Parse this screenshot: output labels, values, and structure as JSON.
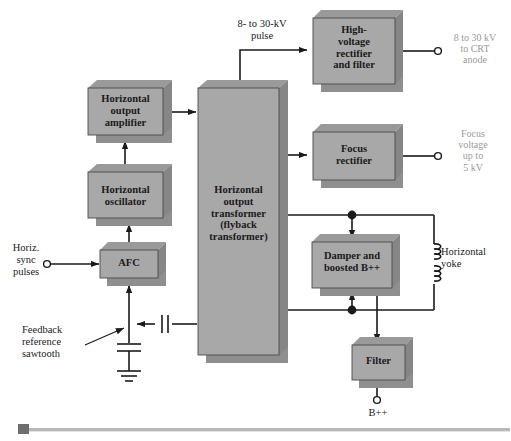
{
  "diagram": {
    "colors": {
      "block_face": "#a8a8a8",
      "block_side": "#8a8a8a",
      "block_shadow": "#8f8f8f",
      "line": "#1a1a1a",
      "gray_label": "#9a9a9a",
      "footer_rule": "#b9b9b9",
      "footer_square": "#6e6e6e"
    },
    "blocks": [
      {
        "id": "hout_amp",
        "label": "Horizontal\noutput\namplifier"
      },
      {
        "id": "hosc",
        "label": "Horizontal\noscillator"
      },
      {
        "id": "afc",
        "label": "AFC"
      },
      {
        "id": "transformer",
        "label": "Horizontal\noutput\ntransformer\n(flyback\ntransformer)"
      },
      {
        "id": "hv_rect",
        "label": "High-\nvoltage\nrectifier\nand filter"
      },
      {
        "id": "focus_rect",
        "label": "Focus\nrectifier"
      },
      {
        "id": "damper",
        "label": "Damper and\nboosted B++"
      },
      {
        "id": "filter",
        "label": "Filter"
      }
    ],
    "signal_labels": [
      {
        "id": "hv_pulse",
        "text": "8- to 30-kV\npulse"
      },
      {
        "id": "sync_in",
        "text": "Horiz.\nsync\npulses"
      },
      {
        "id": "feedback",
        "text": "Feedback\nreference\nsawtooth"
      },
      {
        "id": "yoke",
        "text": "Horizontal\nyoke"
      },
      {
        "id": "bpp_terminal",
        "text": "B++"
      }
    ],
    "output_labels": [
      {
        "id": "crt_anode",
        "text": "8 to 30 kV\nto CRT\nanode"
      },
      {
        "id": "focus_out",
        "text": "Focus\nvoltage\nup to\n5 kV"
      }
    ]
  }
}
